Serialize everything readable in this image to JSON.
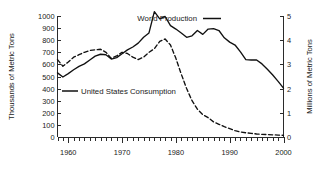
{
  "chart_data": {
    "type": "line",
    "title": "",
    "subtitle": "",
    "xlabel": "",
    "ylabel": "Thousands of Metric Tons",
    "y2label": "Millions of Metric Tons",
    "xlim": [
      1958,
      2000
    ],
    "ylim": [
      0,
      1000
    ],
    "y2lim": [
      0,
      5
    ],
    "grid": false,
    "legend_position": "inside",
    "x_ticks": [
      1960,
      1970,
      1980,
      1990,
      2000
    ],
    "x_tick_labels": [
      "1960",
      "1970",
      "1980",
      "1990",
      "2000"
    ],
    "x_minor_tick_step": 1,
    "y_ticks": [
      0,
      100,
      200,
      300,
      400,
      500,
      600,
      700,
      800,
      900,
      1000
    ],
    "y_tick_labels": [
      "0",
      "100",
      "200",
      "300",
      "400",
      "500",
      "600",
      "700",
      "800",
      "900",
      "1000"
    ],
    "y2_ticks": [
      0,
      1,
      2,
      3,
      4,
      5
    ],
    "y2_tick_labels": [
      "0",
      "1",
      "2",
      "3",
      "4",
      "5"
    ],
    "series": [
      {
        "name": "World Production",
        "axis": "right",
        "units": "Millions of Metric Tons",
        "style": "solid",
        "color": "#111111",
        "x": [
          1958,
          1959,
          1960,
          1961,
          1962,
          1963,
          1964,
          1965,
          1966,
          1967,
          1968,
          1969,
          1970,
          1971,
          1972,
          1973,
          1974,
          1975,
          1976,
          1977,
          1978,
          1979,
          1980,
          1981,
          1982,
          1983,
          1984,
          1985,
          1986,
          1987,
          1988,
          1989,
          1990,
          1991,
          1992,
          1993,
          1994,
          1995,
          1996,
          1997,
          1998,
          1999,
          2000
        ],
        "values": [
          2.65,
          2.48,
          2.62,
          2.78,
          2.92,
          3.02,
          3.18,
          3.34,
          3.42,
          3.4,
          3.22,
          3.28,
          3.44,
          3.6,
          3.72,
          3.88,
          4.12,
          4.3,
          5.18,
          4.88,
          4.98,
          4.6,
          4.46,
          4.3,
          4.12,
          4.18,
          4.4,
          4.24,
          4.46,
          4.48,
          4.4,
          4.1,
          3.92,
          3.8,
          3.52,
          3.2,
          3.18,
          3.18,
          3.02,
          2.8,
          2.56,
          2.3,
          2.02
        ]
      },
      {
        "name": "United States Consumption",
        "axis": "left",
        "units": "Thousands of Metric Tons",
        "style": "dashed",
        "color": "#111111",
        "x": [
          1958,
          1959,
          1960,
          1961,
          1962,
          1963,
          1964,
          1965,
          1966,
          1967,
          1968,
          1969,
          1970,
          1971,
          1972,
          1973,
          1974,
          1975,
          1976,
          1977,
          1978,
          1979,
          1980,
          1981,
          1982,
          1983,
          1984,
          1985,
          1986,
          1987,
          1988,
          1989,
          1990,
          1991,
          1992,
          1993,
          1994,
          1995,
          1996,
          1997,
          1998,
          1999,
          2000
        ],
        "values": [
          640,
          585,
          620,
          660,
          680,
          700,
          715,
          720,
          725,
          700,
          650,
          670,
          700,
          690,
          660,
          640,
          660,
          700,
          730,
          790,
          810,
          760,
          650,
          520,
          400,
          300,
          230,
          185,
          160,
          125,
          105,
          85,
          70,
          52,
          42,
          35,
          30,
          25,
          22,
          20,
          18,
          16,
          14
        ]
      }
    ],
    "annotations": []
  },
  "legend": {
    "world_production_label": "World Production",
    "us_consumption_label": "United States Consumption"
  },
  "axes": {
    "left_title": "Thousands of Metric Tons",
    "right_title": "Millions of Metric Tons"
  }
}
